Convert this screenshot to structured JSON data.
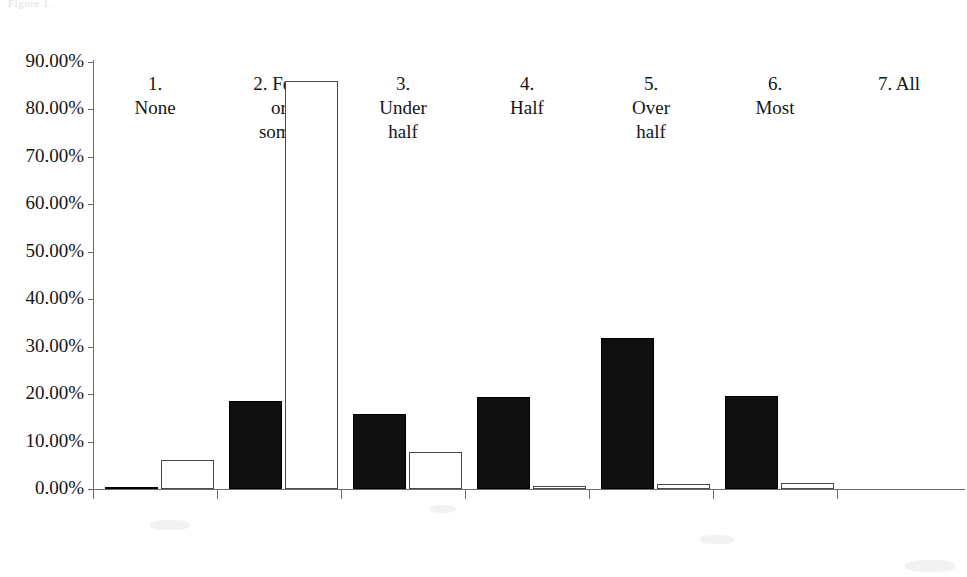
{
  "figure": {
    "caption": "Figure 1.",
    "caption_visible": false
  },
  "chart_data": {
    "type": "bar",
    "title": "",
    "subtitle": "",
    "xlabel": "",
    "ylabel": "",
    "categories": [
      "1.\nNone",
      "2. Few\nor\nsome",
      "3.\nUnder\nhalf",
      "4.\nHalf",
      "5.\nOver\nhalf",
      "6.\nMost",
      "7. All"
    ],
    "series": [
      {
        "name": "Series 1",
        "style": "filled-black",
        "color": "#100f10",
        "values": [
          0.3,
          18.5,
          15.8,
          19.4,
          31.8,
          19.6,
          0.0
        ]
      },
      {
        "name": "Series 2",
        "style": "outline-white",
        "color": "#ffffff",
        "values": [
          6.2,
          86.0,
          7.9,
          0.7,
          1.1,
          1.2,
          0.0
        ]
      }
    ],
    "ylim": [
      0,
      90
    ],
    "ytick_values": [
      0,
      10,
      20,
      30,
      40,
      50,
      60,
      70,
      80,
      90
    ],
    "ytick_labels": [
      "0.00%",
      "10.00%",
      "20.00%",
      "30.00%",
      "40.00%",
      "50.00%",
      "60.00%",
      "70.00%",
      "80.00%",
      "90.00%"
    ],
    "grid": false,
    "legend": "none",
    "value_format": "percent"
  },
  "colors": {
    "axis": "#6d6d6d",
    "text": "#151515",
    "bar_dark": "#100f10",
    "bar_light_fill": "#ffffff",
    "bar_light_stroke": "#4a4a4a",
    "background": "#ffffff"
  }
}
